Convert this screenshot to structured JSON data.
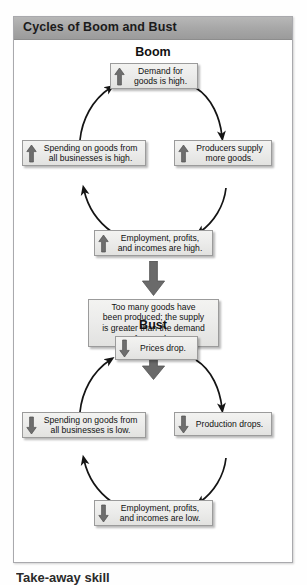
{
  "panel": {
    "title": "Cycles of Boom and Bust"
  },
  "sections": {
    "boom_heading": "Boom",
    "bust_heading": "Bust"
  },
  "boom_cycle": {
    "nodes": [
      {
        "id": "demand",
        "label": "Demand for\ngoods is high.",
        "arrow": "up-arrow-icon"
      },
      {
        "id": "producers",
        "label": "Producers supply\nmore goods.",
        "arrow": "up-arrow-icon"
      },
      {
        "id": "employment",
        "label": "Employment, profits,\nand incomes are high.",
        "arrow": "up-arrow-icon"
      },
      {
        "id": "spending",
        "label": "Spending on goods from\nall businesses is high.",
        "arrow": "up-arrow-icon"
      }
    ]
  },
  "transition": {
    "label": "Too many goods have\nbeen produced; the supply\nis greater than the demand\nfor goods.",
    "arrow_in": "down-arrow-thick-icon",
    "arrow_out": "down-arrow-thick-icon"
  },
  "bust_cycle": {
    "nodes": [
      {
        "id": "prices",
        "label": "Prices drop.",
        "arrow": "down-arrow-icon"
      },
      {
        "id": "production",
        "label": "Production drops.",
        "arrow": "down-arrow-icon"
      },
      {
        "id": "employment",
        "label": "Employment, profits,\nand incomes are low.",
        "arrow": "down-arrow-icon"
      },
      {
        "id": "spending",
        "label": "Spending on goods from\nall businesses is low.",
        "arrow": "down-arrow-icon"
      }
    ]
  },
  "caption": "Take-away skill",
  "colors": {
    "titlebar": "#a6a6a6",
    "panel_border": "#a9a9ad",
    "node_fill": "#ececea",
    "node_border": "#9b9b9b",
    "glyph_arrow": "#6e6e6e",
    "connector": "#141414",
    "big_arrow": "#6a6a6a"
  }
}
